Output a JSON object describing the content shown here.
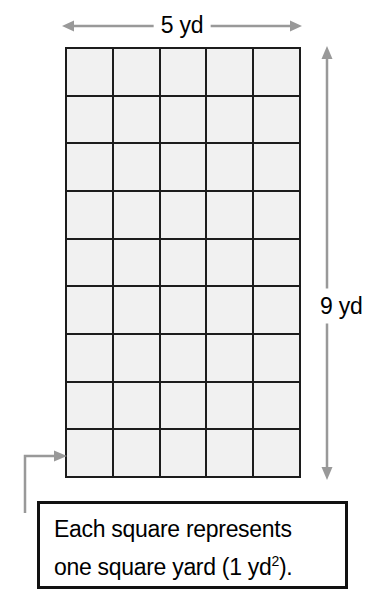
{
  "figure": {
    "type": "area-model-grid",
    "background_color": "#ffffff",
    "line_color": "#1c1c1c",
    "cell_fill_color": "#f1f1f1",
    "arrow_color": "#999999",
    "grid": {
      "columns": 5,
      "rows": 9,
      "total_squares": 45,
      "unit": "square yard"
    },
    "dimensions": {
      "width_label": "5 yd",
      "height_label": "9 yd"
    },
    "caption": {
      "line1": "Each square represents",
      "line2_pre": "one square yard (1 yd",
      "line2_sup": "2",
      "line2_post": ")."
    },
    "icons": {
      "width_arrow": "double-headed-horizontal-arrow-icon",
      "height_arrow": "double-headed-vertical-arrow-icon",
      "leader_arrow": "callout-leader-arrow-icon"
    }
  }
}
